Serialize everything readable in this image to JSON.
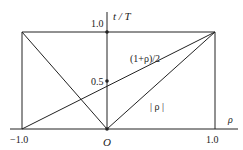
{
  "diagram": {
    "axis_labels": {
      "x": "ρ",
      "y": "t / T"
    },
    "ticks": {
      "x_left": "−1.0",
      "x_origin": "O",
      "x_right": "1.0",
      "y_half": "0.5",
      "y_one": "1.0"
    },
    "curve_labels": {
      "line": "(1+ρ)/2",
      "abs": "| ρ |"
    },
    "colors": {
      "stroke": "#222222",
      "background": "#ffffff"
    }
  }
}
